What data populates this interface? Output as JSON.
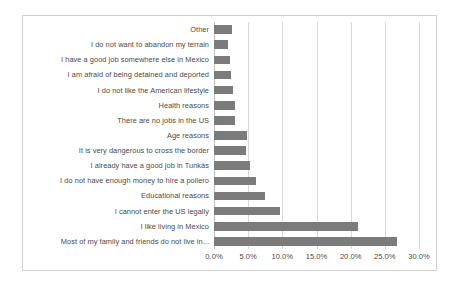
{
  "chart_data": {
    "type": "bar",
    "orientation": "horizontal",
    "title": "",
    "subtitle": "",
    "xlabel": "",
    "ylabel": "",
    "xlim": [
      0,
      30
    ],
    "xticks": [
      "0.0%",
      "5.0%",
      "10.0%",
      "15.0%",
      "20.0%",
      "25.0%",
      "30.0%"
    ],
    "xtick_values": [
      0,
      5,
      10,
      15,
      20,
      25,
      30
    ],
    "grid": true,
    "legend": false,
    "legend_position": "none",
    "bar_color": "#7b7b7b",
    "gridline_color": "#d9d9d9",
    "border_color": "#d0d0d0",
    "categories": [
      "Other",
      "I do not want to abandon my terrain",
      "I have a good job somewhere else in Mexico",
      "I am afraid of being detained and deported",
      "I do not like the American lifestyle",
      "Health reasons",
      "There are no jobs in the US",
      "Age reasons",
      "It is very dangerous to cross the border",
      "I already have a good job in Tunkás",
      "I do not have enough money to hire a pollero",
      "Educational reasons",
      "I cannot enter the US legally",
      "I like living in Mexico",
      "Most of my family and friends do not live in..."
    ],
    "values": [
      2.6,
      2.1,
      2.4,
      2.5,
      2.8,
      3.0,
      3.0,
      4.8,
      4.7,
      5.3,
      6.2,
      7.5,
      9.6,
      21.0,
      26.8
    ]
  }
}
